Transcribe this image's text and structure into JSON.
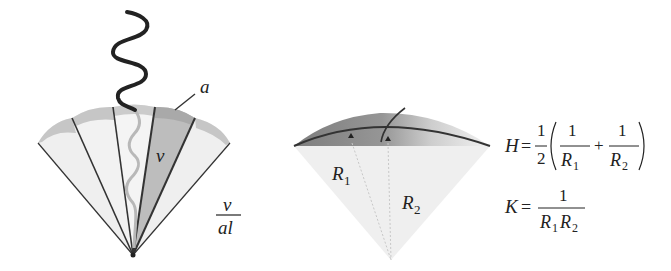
{
  "left_figure": {
    "label_a": "a",
    "label_v": "ν",
    "fraction": {
      "numerator": "ν",
      "denominator": "al"
    }
  },
  "middle_figure": {
    "label_r1": "R",
    "label_r1_sub": "1",
    "label_r2": "R",
    "label_r2_sub": "2"
  },
  "equations": {
    "H": {
      "lhs": "H",
      "eq": "=",
      "half_num": "1",
      "half_den": "2",
      "term1_num": "1",
      "term1_den": "R",
      "term1_sub": "1",
      "plus": "+",
      "term2_num": "1",
      "term2_den": "R",
      "term2_sub": "2"
    },
    "K": {
      "lhs": "K",
      "eq": "=",
      "num": "1",
      "den_a": "R",
      "den_a_sub": "1",
      "den_b": "R",
      "den_b_sub": "2"
    }
  },
  "colors": {
    "fan_light": "#ececec",
    "fan_cap": "#c4c4c4",
    "fan_dark_wedge": "#b8b8b8",
    "line": "#333333",
    "cap_dark": "#777777"
  }
}
